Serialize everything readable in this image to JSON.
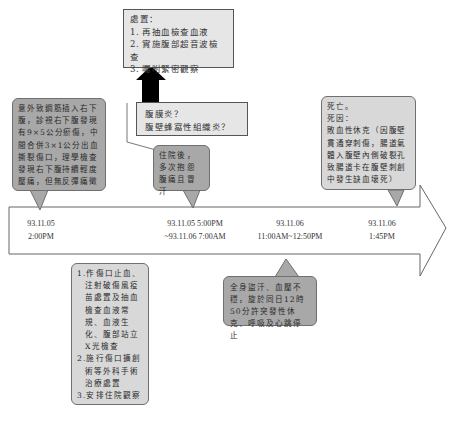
{
  "actions_box": {
    "title": "處置：",
    "items": [
      "1. 再抽血檢查血液",
      "2. 實施腹部超音波檢查",
      "3. 囑咐緊密觀察"
    ]
  },
  "diagnosis_box": {
    "lines": [
      "腹膜炎？",
      "腹壁蜂窩性組織炎？"
    ]
  },
  "callout_injury": {
    "text": "意外致鋼筋插入右下腹，診視右下腹發現有9×5公分瘀傷，中間合併3×1公分出血撕裂傷口，理學檢查發現右下腹持續輕度壓痛，但無反彈痛徵"
  },
  "callout_admission": {
    "text": "住院後，多次抱怨腹痛且冒汗"
  },
  "callout_death": {
    "lines": [
      "死亡。",
      "死因：",
      "敗血性休克（因腹壁貫通穿刺傷，腸道氣體入腹壁內側破裂孔致腸道卡在腹壁刺創中發生缺血壞死）"
    ]
  },
  "callout_treatment": {
    "items": [
      "1.作傷口止血、注射破傷風疫苗處置及抽血檢查血液常規、血液生化、腹部站立X光檢查",
      "2.施行傷口擴創術等外科手術治療處置",
      "3.安排住院觀察"
    ]
  },
  "callout_shock": {
    "text": "全身盜汗、血壓不穩，旋於同日12時50分許突發性休克、呼吸及心跳停止"
  },
  "timeline": {
    "points": [
      {
        "date": "93.11.05",
        "time": "2:00PM"
      },
      {
        "date": "93.11.05 5:00PM",
        "time": "~93.11.06 7:00AM"
      },
      {
        "date": "93.11.06",
        "time": "11:00AM~12:50PM"
      },
      {
        "date": "93.11.06",
        "time": "1:45PM"
      }
    ]
  },
  "colors": {
    "callout_dark": "#a8a8a8",
    "callout_light": "#d8d8d8",
    "box_fill": "#e6e6e6",
    "arrow": "#000000"
  }
}
